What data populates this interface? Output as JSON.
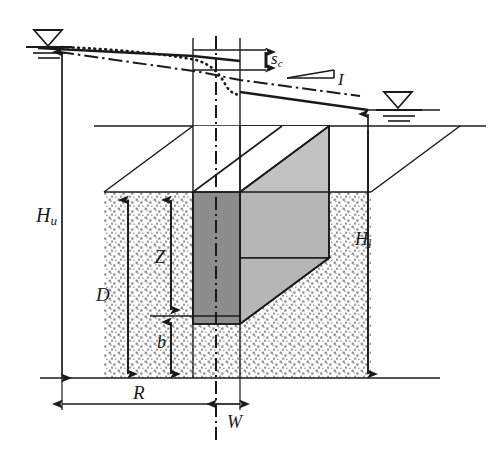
{
  "figure": {
    "type": "engineering-cross-section-diagram",
    "background_color": "#ffffff",
    "line_color": "#1a1a1a"
  },
  "labels": {
    "upstream_head": {
      "base": "H",
      "sub": "u",
      "text": "Hu"
    },
    "downstream_head": {
      "base": "H",
      "sub": "l",
      "text": "Hl"
    },
    "depth": {
      "base": "D",
      "sub": "",
      "text": "D"
    },
    "depth_z": {
      "base": "Z",
      "sub": "",
      "text": "Z"
    },
    "thickness_b": {
      "base": "b",
      "sub": "",
      "text": "b"
    },
    "radius": {
      "base": "R",
      "sub": "",
      "text": "R"
    },
    "half_width": {
      "base": "W",
      "sub": "",
      "text": "W"
    },
    "settlement": {
      "base": "s",
      "sub": "c",
      "text": "sc"
    },
    "gradient": {
      "base": "I",
      "sub": "",
      "text": "I"
    }
  },
  "colors": {
    "dark_face": "#8d8d8d",
    "light_face": "#bdbdbd",
    "mid_face": "#b0b0b0",
    "soil_stipple": "#8f8f8f",
    "soil_base": "#ffffff",
    "outline": "#1a1a1a"
  },
  "symbols": {
    "water_table_left": "water-table-triangle",
    "water_table_right": "water-table-triangle",
    "centerline": "dash-dot-centerline",
    "settlement_curve": "dotted-settlement-trough",
    "hydraulic_grade_line": "dash-dot-phreatic-line",
    "slope_marker": "gradient-slope-marker"
  },
  "geometry": {
    "ground_plane_y": 126,
    "base_y": 378,
    "trench_left_x": 193,
    "trench_center_x": 216,
    "trench_right_x": 240,
    "water_left_x": 62,
    "water_left_y": 46,
    "water_right_x": 368,
    "water_right_y": 110
  }
}
